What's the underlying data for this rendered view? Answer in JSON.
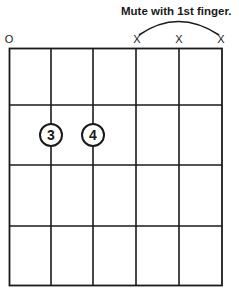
{
  "diagram": {
    "type": "guitar-chord-chart",
    "annotation": "Mute with 1st finger.",
    "string_markers": [
      {
        "string": 1,
        "marker": "O",
        "meaning": "open"
      },
      {
        "string": 2,
        "marker": "",
        "meaning": "none"
      },
      {
        "string": 3,
        "marker": "",
        "meaning": "none"
      },
      {
        "string": 4,
        "marker": "X",
        "meaning": "muted"
      },
      {
        "string": 5,
        "marker": "X",
        "meaning": "muted"
      },
      {
        "string": 6,
        "marker": "X",
        "meaning": "muted"
      }
    ],
    "fingerings": [
      {
        "finger": "3",
        "string": 2,
        "fret": 2
      },
      {
        "finger": "4",
        "string": 3,
        "fret": 2
      }
    ],
    "strings": 6,
    "frets": 4,
    "colors": {
      "line": "#1a1a1a",
      "background": "#ffffff"
    }
  }
}
